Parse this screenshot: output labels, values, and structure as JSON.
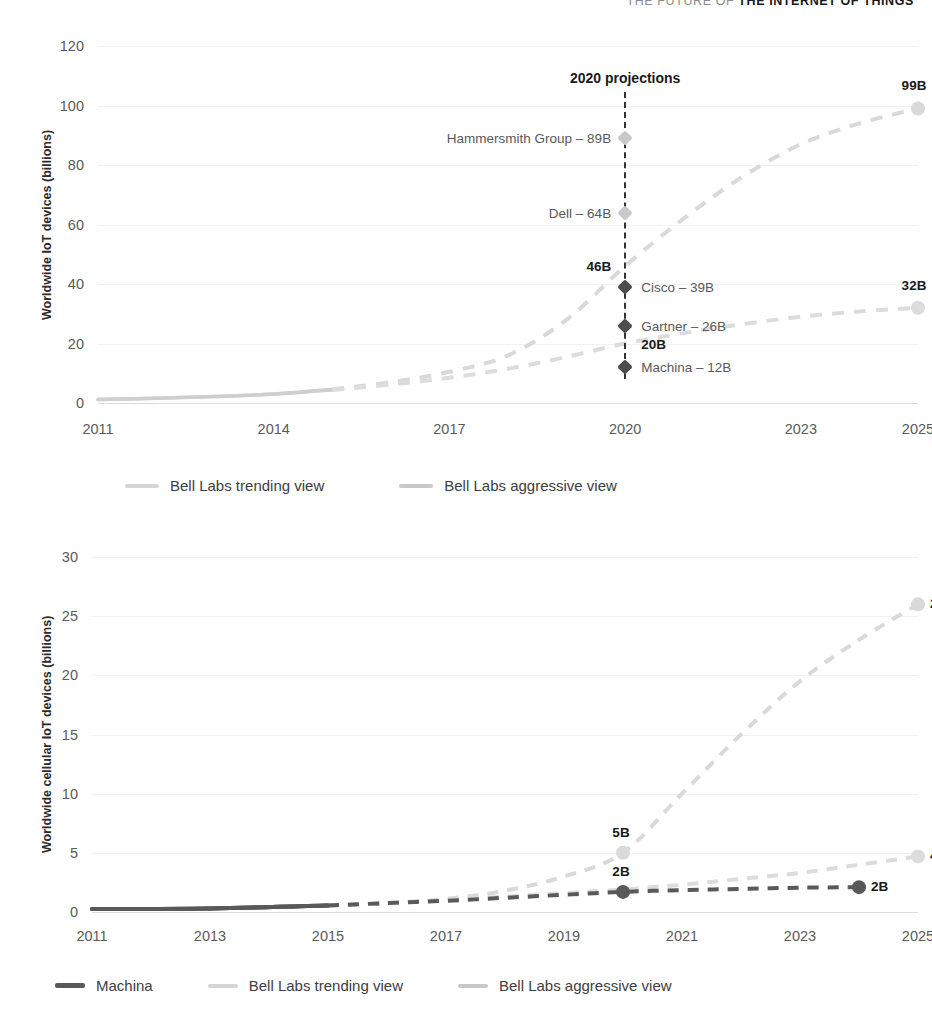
{
  "running_header": {
    "prefix": "THE FUTURE OF ",
    "strong": "THE INTERNET OF THINGS"
  },
  "chart_data": [
    {
      "id": "chart-iot-devices",
      "type": "line",
      "title": "",
      "xlabel": "",
      "ylabel": "Worldwide IoT devices (billions)",
      "xlim": [
        2011,
        2025
      ],
      "ylim": [
        0,
        120
      ],
      "xticks": [
        "2011",
        "2014",
        "2017",
        "2020",
        "2023",
        "2025"
      ],
      "xtick_values": [
        2011,
        2014,
        2017,
        2020,
        2023,
        2025
      ],
      "yticks": [
        "0",
        "20",
        "40",
        "60",
        "80",
        "100",
        "120"
      ],
      "ytick_values": [
        0,
        20,
        40,
        60,
        80,
        100,
        120
      ],
      "grid": true,
      "legend_position": "bottom",
      "series": [
        {
          "name": "Bell Labs aggressive view",
          "color": "#d9d9d9",
          "style": "dashed",
          "x": [
            2011,
            2012,
            2013,
            2014,
            2015,
            2016,
            2017,
            2018,
            2019,
            2020,
            2021,
            2022,
            2023,
            2024,
            2025
          ],
          "values": [
            1.2,
            1.6,
            2.2,
            3.0,
            4.6,
            7.0,
            10.5,
            16.0,
            28.0,
            46.0,
            62.0,
            76.0,
            87.0,
            94.0,
            99.0
          ],
          "end_label": "99B"
        },
        {
          "name": "Bell Labs trending view",
          "color": "#dcdcdc",
          "style": "dashed",
          "x": [
            2011,
            2012,
            2013,
            2014,
            2015,
            2016,
            2017,
            2018,
            2019,
            2020,
            2021,
            2022,
            2023,
            2024,
            2025
          ],
          "values": [
            1.2,
            1.6,
            2.2,
            3.0,
            4.4,
            6.2,
            8.5,
            11.5,
            15.5,
            20.0,
            23.5,
            26.5,
            29.0,
            30.8,
            32.0
          ],
          "end_label": "32B"
        }
      ],
      "annotations": {
        "projection_title": "2020 projections",
        "projection_year": 2020,
        "points": [
          {
            "label": "Hammersmith Group – 89B",
            "value": 89,
            "year": 2020,
            "marker": "light",
            "side": "right",
            "bold": false
          },
          {
            "label": "Dell – 64B",
            "value": 64,
            "year": 2020,
            "marker": "light",
            "side": "right",
            "bold": false
          },
          {
            "label": "46B",
            "value": 46,
            "year": 2020,
            "marker": "none",
            "side": "right",
            "bold": true
          },
          {
            "label": "Cisco – 39B",
            "value": 39,
            "year": 2020,
            "marker": "dark",
            "side": "left",
            "bold": false
          },
          {
            "label": "Gartner – 26B",
            "value": 26,
            "year": 2020,
            "marker": "dark",
            "side": "left",
            "bold": false
          },
          {
            "label": "20B",
            "value": 20,
            "year": 2020,
            "marker": "none",
            "side": "left",
            "bold": true
          },
          {
            "label": "Machina – 12B",
            "value": 12,
            "year": 2020,
            "marker": "dark",
            "side": "left",
            "bold": false
          }
        ]
      },
      "legend": [
        {
          "label": "Bell Labs trending view",
          "color": "#d5d5d5"
        },
        {
          "label": "Bell Labs aggressive view",
          "color": "#c9c9c9"
        }
      ]
    },
    {
      "id": "chart-cellular-iot-devices",
      "type": "line",
      "title": "",
      "xlabel": "",
      "ylabel": "Worldwide cellular IoT devices (billions)",
      "xlim": [
        2011,
        2025
      ],
      "ylim": [
        0,
        30
      ],
      "xticks": [
        "2011",
        "2013",
        "2015",
        "2017",
        "2019",
        "2021",
        "2023",
        "2025"
      ],
      "xtick_values": [
        2011,
        2013,
        2015,
        2017,
        2019,
        2021,
        2023,
        2025
      ],
      "yticks": [
        "0",
        "5",
        "10",
        "15",
        "20",
        "25",
        "30"
      ],
      "ytick_values": [
        0,
        5,
        10,
        15,
        20,
        25,
        30
      ],
      "grid": true,
      "legend_position": "bottom",
      "series": [
        {
          "name": "Bell Labs aggressive view",
          "color": "#d9d9d9",
          "style": "dashed",
          "x": [
            2011,
            2013,
            2015,
            2016,
            2017,
            2018,
            2019,
            2020,
            2021,
            2022,
            2023,
            2024,
            2025
          ],
          "values": [
            0.25,
            0.3,
            0.55,
            0.75,
            1.1,
            1.8,
            3.0,
            5.0,
            10.0,
            15.0,
            19.5,
            23.0,
            26.0
          ],
          "end_label": "26B",
          "mid_label": "5B",
          "mid_year": 2020
        },
        {
          "name": "Bell Labs trending view",
          "color": "#dcdcdc",
          "style": "dashed",
          "x": [
            2011,
            2013,
            2015,
            2016,
            2017,
            2018,
            2019,
            2020,
            2021,
            2022,
            2023,
            2024,
            2025
          ],
          "values": [
            0.25,
            0.3,
            0.55,
            0.75,
            1.0,
            1.3,
            1.6,
            1.9,
            2.3,
            2.8,
            3.3,
            4.0,
            4.7
          ],
          "end_label": "4B"
        },
        {
          "name": "Machina",
          "color": "#595959",
          "style": "dashed",
          "x": [
            2011,
            2013,
            2015,
            2016,
            2017,
            2018,
            2019,
            2020,
            2021,
            2022,
            2023,
            2024
          ],
          "values": [
            0.25,
            0.3,
            0.55,
            0.75,
            0.95,
            1.2,
            1.45,
            1.7,
            1.85,
            1.95,
            2.05,
            2.1
          ],
          "end_label": "2B",
          "mid_label": "2B",
          "mid_year": 2020
        }
      ],
      "legend": [
        {
          "label": "Machina",
          "color": "#595959"
        },
        {
          "label": "Bell Labs trending view",
          "color": "#d5d5d5"
        },
        {
          "label": "Bell Labs aggressive view",
          "color": "#c9c9c9"
        }
      ]
    }
  ]
}
